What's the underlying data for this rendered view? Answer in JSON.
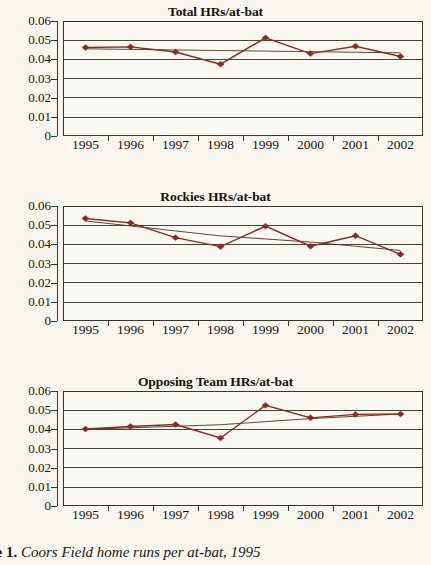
{
  "figure": {
    "caption_prefix": "Figure 1.",
    "caption_text": "Coors Field home runs per at-bat, 1995"
  },
  "axis": {
    "y_ticks": [
      "0.06",
      "0.05",
      "0.04",
      "0.03",
      "0.02",
      "0.01",
      "0"
    ],
    "x_ticks": [
      "1995",
      "1996",
      "1997",
      "1998",
      "1999",
      "2000",
      "2001",
      "2002"
    ]
  },
  "colors": {
    "series": "#8c2a22",
    "trend": "#4a3326",
    "axis": "#3a352c",
    "grid": "#4a443a",
    "background": "#f8f6ef",
    "plot_background": "#faf8f2"
  },
  "charts": [
    {
      "title": "Total HRs/at-bat",
      "chart_data": {
        "type": "line",
        "title": "Total HRs/at-bat",
        "xlabel": "",
        "ylabel": "",
        "x": [
          1995,
          1996,
          1997,
          1998,
          1999,
          2000,
          2001,
          2002
        ],
        "categories": [
          "1995",
          "1996",
          "1997",
          "1998",
          "1999",
          "2000",
          "2001",
          "2002"
        ],
        "ylim": [
          0,
          0.06
        ],
        "yticks": [
          0,
          0.01,
          0.02,
          0.03,
          0.04,
          0.05,
          0.06
        ],
        "grid": true,
        "legend": "none",
        "series": [
          {
            "name": "Total HRs/at-bat",
            "marker": "diamond",
            "values": [
              0.0462,
              0.0465,
              0.0438,
              0.0375,
              0.0512,
              0.043,
              0.0468,
              0.0415
            ]
          },
          {
            "name": "Linear trend",
            "marker": "none",
            "values": [
              0.0455,
              0.0452,
              0.0449,
              0.0446,
              0.0443,
              0.044,
              0.0437,
              0.0434
            ]
          }
        ]
      }
    },
    {
      "title": "Rockies HRs/at-bat",
      "chart_data": {
        "type": "line",
        "title": "Rockies HRs/at-bat",
        "xlabel": "",
        "ylabel": "",
        "x": [
          1995,
          1996,
          1997,
          1998,
          1999,
          2000,
          2001,
          2002
        ],
        "categories": [
          "1995",
          "1996",
          "1997",
          "1998",
          "1999",
          "2000",
          "2001",
          "2002"
        ],
        "ylim": [
          0,
          0.06
        ],
        "yticks": [
          0,
          0.01,
          0.02,
          0.03,
          0.04,
          0.05,
          0.06
        ],
        "grid": true,
        "legend": "none",
        "series": [
          {
            "name": "Rockies HRs/at-bat",
            "marker": "diamond",
            "values": [
              0.0535,
              0.0512,
              0.0435,
              0.0388,
              0.0495,
              0.039,
              0.0445,
              0.0348
            ]
          },
          {
            "name": "Linear trend",
            "marker": "none",
            "values": [
              0.0522,
              0.0496,
              0.047,
              0.0444,
              0.0428,
              0.0412,
              0.039,
              0.0368
            ]
          }
        ]
      }
    },
    {
      "title": "Opposing Team HRs/at-bat",
      "chart_data": {
        "type": "line",
        "title": "Opposing Team HRs/at-bat",
        "xlabel": "",
        "ylabel": "",
        "x": [
          1995,
          1996,
          1997,
          1998,
          1999,
          2000,
          2001,
          2002
        ],
        "categories": [
          "1995",
          "1996",
          "1997",
          "1998",
          "1999",
          "2000",
          "2001",
          "2002"
        ],
        "ylim": [
          0,
          0.06
        ],
        "yticks": [
          0,
          0.01,
          0.02,
          0.03,
          0.04,
          0.05,
          0.06
        ],
        "grid": true,
        "legend": "none",
        "series": [
          {
            "name": "Opposing Team HRs/at-bat",
            "marker": "diamond",
            "values": [
              0.0402,
              0.0415,
              0.0425,
              0.0355,
              0.0525,
              0.046,
              0.0478,
              0.048
            ]
          },
          {
            "name": "Linear trend",
            "marker": "none",
            "values": [
              0.04,
              0.0408,
              0.0416,
              0.0424,
              0.044,
              0.0456,
              0.0468,
              0.048
            ]
          }
        ]
      }
    }
  ]
}
